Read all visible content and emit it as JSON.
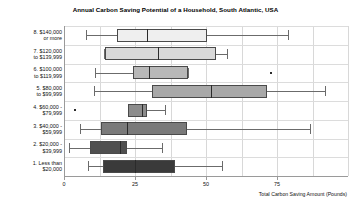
{
  "chart_data": {
    "type": "box",
    "title": "Annual Carbon Saving Potential of a Household, South Atlantic, USA",
    "xlabel": "Total Carbon Saving Amount (Pounds)",
    "ylabel": "",
    "xlim": [
      0,
      100
    ],
    "xticks": [
      0,
      25,
      50,
      75
    ],
    "xticklabels": [
      "0",
      "25",
      "50",
      "75"
    ],
    "grid": "vertical",
    "orientation": "horizontal",
    "categories": [
      "8. $140,000 or more",
      "7. $120,000 to $139,999",
      "6. $100,000 to $119,999",
      "5. $80,000 to $99,999",
      "4. $60,000 to $79,999",
      "3. $40,000 - $59,999",
      "2. $20,000 - $39,999",
      "1. Less than $20,000"
    ],
    "boxes": [
      {
        "category": "8. $140,000 or more",
        "whisker_low": 7.7,
        "q1": 18.7,
        "median": 29.2,
        "q3": 50.4,
        "whisker_high": 78.9,
        "outliers": [],
        "fill": "#efefef"
      },
      {
        "category": "7. $120,000 to $139,999",
        "whisker_low": 14.1,
        "q1": 14.4,
        "median": 33.1,
        "q3": 53.5,
        "whisker_high": 57.4,
        "outliers": [],
        "fill": "#d9d9d9"
      },
      {
        "category": "6. $100,000 to $119,999",
        "whisker_low": 10.9,
        "q1": 24.3,
        "median": 29.9,
        "q3": 43.7,
        "whisker_high": 43.7,
        "outliers": [
          72.5
        ],
        "fill": "#b8b8b8"
      },
      {
        "category": "5. $80,000 to $99,999",
        "whisker_low": 10.6,
        "q1": 31.0,
        "median": 51.8,
        "q3": 71.5,
        "whisker_high": 91.9,
        "outliers": [],
        "fill": "#a8a8a8"
      },
      {
        "category": "4. $60,000 to $79,999",
        "whisker_low": 22.5,
        "q1": 22.5,
        "median": 27.5,
        "q3": 29.2,
        "whisker_high": 35.6,
        "outliers": [
          3.5
        ],
        "fill": "#8c8c8c"
      },
      {
        "category": "3. $40,000 - $59,999",
        "whisker_low": 5.6,
        "q1": 13.0,
        "median": 22.2,
        "q3": 43.3,
        "whisker_high": 86.6,
        "outliers": [],
        "fill": "#7a7a7a"
      },
      {
        "category": "2. $20,000 - $39,999",
        "whisker_low": 1.8,
        "q1": 9.2,
        "median": 19.7,
        "q3": 22.2,
        "whisker_high": 34.5,
        "outliers": [],
        "fill": "#4f4f4f"
      },
      {
        "category": "1. Less than $20,000",
        "whisker_low": 8.5,
        "q1": 13.7,
        "median": 25.0,
        "q3": 39.1,
        "whisker_high": 55.6,
        "outliers": [],
        "fill": "#3a3a3a"
      }
    ]
  },
  "axis": {
    "x_title": "Total Carbon Saving Amount (Pounds)",
    "tick_0": "0",
    "tick_1": "25",
    "tick_2": "50",
    "tick_3": "75"
  },
  "ylabels": [
    "8. $140,000\nor more",
    "7. $120,000\nto $139,999",
    "6. $100,000\nto $119,999",
    "5. $80,000\nto $99,999",
    "4. $60,000 -\n$79,999",
    "3. $40,000 -\n$59,999",
    "2. $20,000 -\n$39,999",
    "1. Less than\n$20,000"
  ],
  "colors": {
    "axis": "#9a9a9a",
    "grid": "#d8d8d8",
    "box_edge": "#4a4a4a",
    "whisker": "#6b6b6b"
  }
}
